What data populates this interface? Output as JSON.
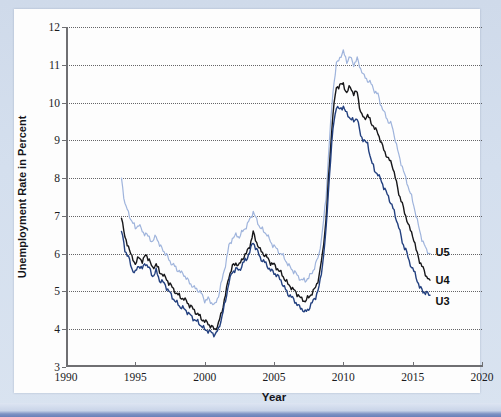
{
  "figure": {
    "background_color": "#d4dfee",
    "card_color": "#fdfdfd",
    "accent_band_color": "#6a80b8"
  },
  "chart_data": {
    "type": "line",
    "title": "",
    "subtitle": "",
    "xlabel": "Year",
    "ylabel": "Unemployment Rate in Percent",
    "xlim": [
      1990,
      2020
    ],
    "ylim": [
      3,
      12
    ],
    "xticks": [
      1990,
      1995,
      2000,
      2005,
      2010,
      2015,
      2020
    ],
    "yticks": [
      3,
      4,
      5,
      6,
      7,
      8,
      9,
      10,
      11,
      12
    ],
    "xtick_labels": [
      "1990",
      "1995",
      "2000",
      "2005",
      "2010",
      "2015",
      "2020"
    ],
    "ytick_labels": [
      "3",
      "4",
      "5",
      "6",
      "7",
      "8",
      "9",
      "10",
      "11",
      "12"
    ],
    "grid": "horizontal-dotted",
    "legend_position": "inline-right-end-of-line",
    "annotations": [
      {
        "text": "U5",
        "x": 2016.5,
        "y": 6.05
      },
      {
        "text": "U4",
        "x": 2016.5,
        "y": 5.3
      },
      {
        "text": "U3",
        "x": 2016.5,
        "y": 4.75
      }
    ],
    "series": [
      {
        "name": "U5",
        "label": "U5",
        "color": "#9fb4dc",
        "x": [
          1994.0,
          1994.25,
          1994.5,
          1994.75,
          1995.0,
          1995.25,
          1995.5,
          1995.75,
          1996.0,
          1996.25,
          1996.5,
          1996.75,
          1997.0,
          1997.25,
          1997.5,
          1997.75,
          1998.0,
          1998.25,
          1998.5,
          1998.75,
          1999.0,
          1999.25,
          1999.5,
          1999.75,
          2000.0,
          2000.25,
          2000.5,
          2000.75,
          2001.0,
          2001.25,
          2001.5,
          2001.75,
          2002.0,
          2002.25,
          2002.5,
          2002.75,
          2003.0,
          2003.25,
          2003.5,
          2003.75,
          2004.0,
          2004.25,
          2004.5,
          2004.75,
          2005.0,
          2005.25,
          2005.5,
          2005.75,
          2006.0,
          2006.25,
          2006.5,
          2006.75,
          2007.0,
          2007.25,
          2007.5,
          2007.75,
          2008.0,
          2008.25,
          2008.5,
          2008.75,
          2009.0,
          2009.25,
          2009.5,
          2009.75,
          2010.0,
          2010.25,
          2010.5,
          2010.75,
          2011.0,
          2011.25,
          2011.5,
          2011.75,
          2012.0,
          2012.25,
          2012.5,
          2012.75,
          2013.0,
          2013.25,
          2013.5,
          2013.75,
          2014.0,
          2014.25,
          2014.5,
          2014.75,
          2015.0,
          2015.25,
          2015.5,
          2015.75,
          2016.0,
          2016.25
        ],
        "y": [
          8.0,
          7.3,
          7.1,
          6.85,
          6.7,
          6.75,
          6.6,
          6.5,
          6.45,
          6.3,
          6.5,
          6.2,
          6.1,
          5.95,
          5.8,
          5.7,
          5.6,
          5.5,
          5.45,
          5.3,
          5.2,
          5.1,
          5.05,
          4.95,
          4.75,
          4.8,
          4.7,
          4.65,
          4.9,
          5.3,
          5.7,
          6.2,
          6.4,
          6.5,
          6.45,
          6.6,
          6.7,
          6.9,
          7.1,
          6.9,
          6.7,
          6.6,
          6.5,
          6.3,
          6.2,
          6.1,
          6.0,
          5.9,
          5.7,
          5.6,
          5.5,
          5.4,
          5.3,
          5.3,
          5.35,
          5.5,
          5.7,
          6.0,
          6.6,
          7.5,
          9.0,
          10.3,
          11.0,
          11.2,
          11.35,
          11.1,
          11.2,
          11.0,
          11.15,
          10.9,
          10.7,
          10.6,
          10.5,
          10.3,
          10.2,
          9.9,
          9.7,
          9.5,
          9.4,
          9.0,
          8.6,
          8.3,
          8.0,
          7.7,
          7.4,
          7.0,
          6.6,
          6.3,
          6.1,
          6.0
        ]
      },
      {
        "name": "U4",
        "label": "U4",
        "color": "#17171a",
        "x": [
          1994.0,
          1994.25,
          1994.5,
          1994.75,
          1995.0,
          1995.25,
          1995.5,
          1995.75,
          1996.0,
          1996.25,
          1996.5,
          1996.75,
          1997.0,
          1997.25,
          1997.5,
          1997.75,
          1998.0,
          1998.25,
          1998.5,
          1998.75,
          1999.0,
          1999.25,
          1999.5,
          1999.75,
          2000.0,
          2000.25,
          2000.5,
          2000.75,
          2001.0,
          2001.25,
          2001.5,
          2001.75,
          2002.0,
          2002.25,
          2002.5,
          2002.75,
          2003.0,
          2003.25,
          2003.5,
          2003.75,
          2004.0,
          2004.25,
          2004.5,
          2004.75,
          2005.0,
          2005.25,
          2005.5,
          2005.75,
          2006.0,
          2006.25,
          2006.5,
          2006.75,
          2007.0,
          2007.25,
          2007.5,
          2007.75,
          2008.0,
          2008.25,
          2008.5,
          2008.75,
          2009.0,
          2009.25,
          2009.5,
          2009.75,
          2010.0,
          2010.25,
          2010.5,
          2010.75,
          2011.0,
          2011.25,
          2011.5,
          2011.75,
          2012.0,
          2012.25,
          2012.5,
          2012.75,
          2013.0,
          2013.25,
          2013.5,
          2013.75,
          2014.0,
          2014.25,
          2014.5,
          2014.75,
          2015.0,
          2015.25,
          2015.5,
          2015.75,
          2016.0,
          2016.25
        ],
        "y": [
          7.0,
          6.4,
          6.2,
          5.9,
          5.75,
          5.9,
          5.8,
          5.95,
          5.85,
          5.6,
          5.75,
          5.5,
          5.45,
          5.3,
          5.2,
          5.05,
          4.95,
          4.85,
          4.8,
          4.7,
          4.6,
          4.5,
          4.4,
          4.3,
          4.2,
          4.15,
          4.05,
          4.0,
          4.15,
          4.5,
          4.9,
          5.4,
          5.65,
          5.75,
          5.7,
          5.9,
          6.0,
          6.2,
          6.55,
          6.3,
          6.1,
          6.0,
          5.9,
          5.75,
          5.7,
          5.6,
          5.5,
          5.35,
          5.2,
          5.1,
          5.0,
          4.9,
          4.8,
          4.75,
          4.85,
          4.95,
          5.1,
          5.4,
          6.0,
          6.9,
          8.4,
          9.7,
          10.4,
          10.45,
          10.5,
          10.25,
          10.45,
          10.2,
          10.3,
          9.7,
          9.6,
          9.65,
          9.5,
          9.3,
          9.2,
          8.9,
          8.7,
          8.5,
          8.4,
          8.0,
          7.6,
          7.3,
          7.0,
          6.7,
          6.5,
          6.1,
          5.8,
          5.6,
          5.4,
          5.3
        ]
      },
      {
        "name": "U3",
        "label": "U3",
        "color": "#23407f",
        "x": [
          1994.0,
          1994.25,
          1994.5,
          1994.75,
          1995.0,
          1995.25,
          1995.5,
          1995.75,
          1996.0,
          1996.25,
          1996.5,
          1996.75,
          1997.0,
          1997.25,
          1997.5,
          1997.75,
          1998.0,
          1998.25,
          1998.5,
          1998.75,
          1999.0,
          1999.25,
          1999.5,
          1999.75,
          2000.0,
          2000.25,
          2000.5,
          2000.75,
          2001.0,
          2001.25,
          2001.5,
          2001.75,
          2002.0,
          2002.25,
          2002.5,
          2002.75,
          2003.0,
          2003.25,
          2003.5,
          2003.75,
          2004.0,
          2004.25,
          2004.5,
          2004.75,
          2005.0,
          2005.25,
          2005.5,
          2005.75,
          2006.0,
          2006.25,
          2006.5,
          2006.75,
          2007.0,
          2007.25,
          2007.5,
          2007.75,
          2008.0,
          2008.25,
          2008.5,
          2008.75,
          2009.0,
          2009.25,
          2009.5,
          2009.75,
          2010.0,
          2010.25,
          2010.5,
          2010.75,
          2011.0,
          2011.25,
          2011.5,
          2011.75,
          2012.0,
          2012.25,
          2012.5,
          2012.75,
          2013.0,
          2013.25,
          2013.5,
          2013.75,
          2014.0,
          2014.25,
          2014.5,
          2014.75,
          2015.0,
          2015.25,
          2015.5,
          2015.75,
          2016.0,
          2016.25
        ],
        "y": [
          6.6,
          6.1,
          5.9,
          5.6,
          5.5,
          5.7,
          5.6,
          5.75,
          5.6,
          5.4,
          5.55,
          5.3,
          5.25,
          5.1,
          4.95,
          4.8,
          4.7,
          4.6,
          4.55,
          4.45,
          4.35,
          4.25,
          4.2,
          4.1,
          4.0,
          3.95,
          3.9,
          3.85,
          4.0,
          4.35,
          4.75,
          5.25,
          5.5,
          5.6,
          5.55,
          5.75,
          5.85,
          6.05,
          6.3,
          6.1,
          5.9,
          5.8,
          5.7,
          5.55,
          5.5,
          5.4,
          5.3,
          5.1,
          4.95,
          4.85,
          4.75,
          4.6,
          4.55,
          4.45,
          4.55,
          4.7,
          4.85,
          5.1,
          5.7,
          6.6,
          8.1,
          9.3,
          9.9,
          9.8,
          9.9,
          9.7,
          9.6,
          9.5,
          9.6,
          9.1,
          9.0,
          8.9,
          8.5,
          8.2,
          8.1,
          7.9,
          7.7,
          7.5,
          7.3,
          7.0,
          6.7,
          6.3,
          6.1,
          5.8,
          5.6,
          5.4,
          5.1,
          5.0,
          4.95,
          4.9
        ]
      }
    ]
  }
}
